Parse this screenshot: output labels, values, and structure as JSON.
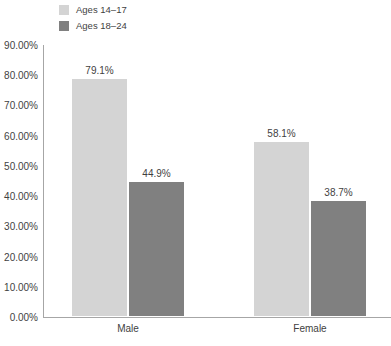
{
  "chart_data": {
    "type": "bar",
    "title": "",
    "subtitle": "",
    "xlabel": "",
    "ylabel": "",
    "categories": [
      "Male",
      "Female"
    ],
    "series": [
      {
        "name": "Ages 14–17",
        "color": "#d4d4d4",
        "values": [
          79.1,
          58.1
        ],
        "labels": [
          "79.1%",
          "44.9%"
        ]
      },
      {
        "name": "Ages 18–24",
        "color": "#808080",
        "values": [
          44.9,
          38.7
        ],
        "labels": [
          "58.1%",
          "38.7%"
        ]
      }
    ],
    "bars": [
      {
        "category": "Male",
        "series": "Ages 14–17",
        "value": 79.1,
        "label": "79.1%",
        "color": "#d4d4d4"
      },
      {
        "category": "Male",
        "series": "Ages 18–24",
        "value": 44.9,
        "label": "44.9%",
        "color": "#808080"
      },
      {
        "category": "Female",
        "series": "Ages 14–17",
        "value": 58.1,
        "label": "58.1%",
        "color": "#d4d4d4"
      },
      {
        "category": "Female",
        "series": "Ages 18–24",
        "value": 38.7,
        "label": "38.7%",
        "color": "#808080"
      }
    ],
    "ylim": [
      0,
      90
    ],
    "ytick_values": [
      90,
      80,
      70,
      60,
      50,
      40,
      30,
      20,
      10,
      0
    ],
    "ytick_labels": [
      "90.00%",
      "80.00%",
      "70.00%",
      "60.00%",
      "50.00%",
      "40.00%",
      "30.00%",
      "20.00%",
      "10.00%",
      "0.00%"
    ],
    "grid": false,
    "legend_position": "top-left",
    "axis_color": "#a6a6a6",
    "text_color": "#3f3f3f"
  },
  "legend": {
    "items": [
      {
        "label": "Ages 14–17",
        "color": "#d4d4d4"
      },
      {
        "label": "Ages 18–24",
        "color": "#808080"
      }
    ]
  },
  "xaxis": {
    "ticks": [
      {
        "label": "Male"
      },
      {
        "label": "Female"
      }
    ]
  },
  "caption": {
    "clipped_text": ""
  }
}
